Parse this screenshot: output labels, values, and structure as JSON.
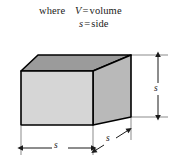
{
  "figure": {
    "legend": {
      "where_label": "where",
      "definitions": [
        {
          "symbol": "V",
          "equals": "=",
          "meaning": "volume"
        },
        {
          "symbol": "s",
          "equals": "=",
          "meaning": "side"
        }
      ]
    },
    "dimensions": [
      {
        "name": "height",
        "label": "s",
        "orientation": "vertical",
        "position": "right"
      },
      {
        "name": "width",
        "label": "s",
        "orientation": "horizontal",
        "position": "bottom"
      },
      {
        "name": "depth",
        "label": "s",
        "orientation": "diagonal",
        "position": "bottom-right"
      }
    ],
    "solid": {
      "shape": "cube",
      "front_face_color": "#d6d6d6",
      "top_face_color": "#9b9b9b",
      "side_face_color": "#b9b9b9",
      "outline_color": "#000000"
    }
  }
}
